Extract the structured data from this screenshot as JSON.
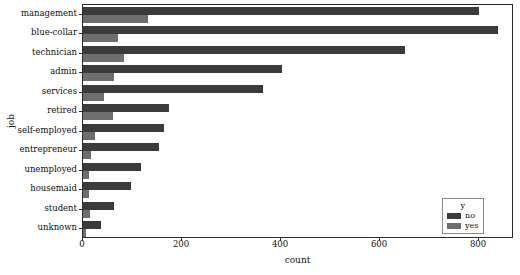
{
  "chart_data": {
    "type": "bar",
    "orientation": "horizontal",
    "title": "",
    "xlabel": "count",
    "ylabel": "job",
    "xlim": [
      0,
      871
    ],
    "xticks": [
      0,
      200,
      400,
      600,
      800
    ],
    "xtick_labels": [
      "0",
      "200",
      "400",
      "600",
      "800"
    ],
    "grid": false,
    "categories": [
      "management",
      "blue-collar",
      "technician",
      "admin",
      "services",
      "retired",
      "self-employed",
      "entrepreneur",
      "unemployed",
      "housemaid",
      "student",
      "unknown"
    ],
    "series": [
      {
        "name": "no",
        "color": "#3b3b3b",
        "values": [
          800,
          838,
          650,
          402,
          364,
          174,
          164,
          153,
          118,
          97,
          63,
          37
        ]
      },
      {
        "name": "yes",
        "color": "#6e6e6e",
        "values": [
          131,
          70,
          83,
          63,
          42,
          61,
          24,
          16,
          12,
          12,
          14,
          7
        ]
      }
    ],
    "legend": {
      "title": "y",
      "position": "lower right",
      "entries": [
        {
          "label": "no",
          "color": "#3b3b3b"
        },
        {
          "label": "yes",
          "color": "#6e6e6e"
        }
      ]
    }
  }
}
